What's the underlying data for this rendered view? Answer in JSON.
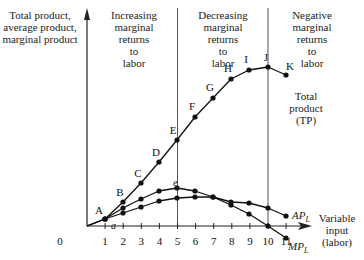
{
  "chart_data": {
    "type": "line",
    "title": "",
    "ylabel": "Total product, average product, marginal product",
    "xlabel": "Variable input (labor)",
    "x": [
      1,
      2,
      3,
      4,
      5,
      6,
      7,
      8,
      9,
      10,
      11
    ],
    "x_ticks": [
      "0",
      "1",
      "2",
      "3",
      "4",
      "5",
      "6",
      "7",
      "8",
      "9",
      "10",
      "11"
    ],
    "grid": false,
    "regions": [
      {
        "label": "Increasing marginal returns to labor",
        "x_range": [
          0,
          5
        ]
      },
      {
        "label": "Decreasing marginal returns to labor",
        "x_range": [
          5,
          10
        ]
      },
      {
        "label": "Negative marginal returns to labor",
        "x_range": [
          10,
          11
        ]
      }
    ],
    "series": [
      {
        "name": "Total product (TP)",
        "point_labels": [
          "A",
          "B",
          "C",
          "D",
          "E",
          "F",
          "G",
          "H",
          "I",
          "J",
          "K"
        ],
        "px": [
          [
            105,
            219
          ],
          [
            123,
            202
          ],
          [
            141,
            183
          ],
          [
            159,
            162
          ],
          [
            177,
            140
          ],
          [
            195,
            117
          ],
          [
            213,
            98
          ],
          [
            231,
            79
          ],
          [
            249,
            70
          ],
          [
            268,
            67
          ],
          [
            286,
            75
          ]
        ]
      },
      {
        "name": "MP_L",
        "point_labels": [
          "a",
          "",
          "",
          "",
          "e",
          "",
          "",
          "",
          "",
          "",
          ""
        ],
        "px": [
          [
            105,
            219
          ],
          [
            123,
            208
          ],
          [
            141,
            199
          ],
          [
            159,
            191
          ],
          [
            177,
            188
          ],
          [
            195,
            191
          ],
          [
            213,
            197
          ],
          [
            231,
            205
          ],
          [
            249,
            214
          ],
          [
            268,
            226
          ],
          [
            286,
            238
          ]
        ]
      },
      {
        "name": "AP_L",
        "px": [
          [
            105,
            219
          ],
          [
            123,
            213
          ],
          [
            141,
            207
          ],
          [
            159,
            201
          ],
          [
            177,
            198
          ],
          [
            195,
            197
          ],
          [
            213,
            197
          ],
          [
            231,
            202
          ],
          [
            249,
            203
          ],
          [
            268,
            208
          ],
          [
            286,
            216
          ]
        ]
      }
    ],
    "annotations": [
      "A",
      "B",
      "C",
      "D",
      "E",
      "F",
      "G",
      "H",
      "I",
      "J",
      "K",
      "a",
      "e",
      "Total product (TP)",
      "AP_L",
      "MP_L"
    ]
  },
  "labels": {
    "ylabel_lines": [
      "Total product,",
      "average product,",
      "marginal product"
    ],
    "region1_lines": [
      "Increasing",
      "marginal",
      "returns",
      "to",
      "labor"
    ],
    "region2_lines": [
      "Decreasing",
      "marginal",
      "returns",
      "to",
      "labor"
    ],
    "region3_lines": [
      "Negative",
      "marginal",
      "returns",
      "to",
      "labor"
    ],
    "xlabel_lines": [
      "Variable",
      "input",
      "(labor)"
    ],
    "tp_lines": [
      "Total",
      "product",
      "(TP)"
    ],
    "ap": "AP",
    "ap_sub": "L",
    "mp": "MP",
    "mp_sub": "L"
  },
  "colors": {
    "ink": "#111111",
    "axis": "#222222",
    "divider": "#555555"
  }
}
